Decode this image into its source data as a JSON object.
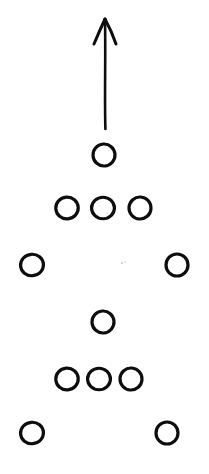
{
  "canvas": {
    "width": 209,
    "height": 474,
    "background_color": "#ffffff",
    "ink_color": "#0d0d0d",
    "title": "Formation Diagram"
  },
  "diagram": {
    "kind": "football-play-formation",
    "stroke_color": "#0d0d0d",
    "circle_radius": 11,
    "circle_stroke_width": 3.2,
    "arrow_stroke_width": 2.6
  },
  "arrow": {
    "name": "upward-route-arrow",
    "direction": "up",
    "tip_x": 105,
    "tip_y": 19,
    "tail_x": 105,
    "tail_y": 129,
    "head_left_x": 94,
    "head_left_y": 44,
    "head_right_x": 116,
    "head_right_y": 44,
    "length": 110
  },
  "rows": [
    {
      "name": "row-1-top-single",
      "label": "Top single",
      "count": 1,
      "cy": 155,
      "circles": [
        {
          "name": "player-r1-c1",
          "cx": 104,
          "cy": 155,
          "r": 11
        }
      ]
    },
    {
      "name": "row-2-triple",
      "label": "Upper triple",
      "count": 3,
      "cy": 208,
      "circles": [
        {
          "name": "player-r2-c1",
          "cx": 67,
          "cy": 208,
          "r": 11
        },
        {
          "name": "player-r2-c2",
          "cx": 103,
          "cy": 208,
          "r": 11
        },
        {
          "name": "player-r2-c3",
          "cx": 140,
          "cy": 208,
          "r": 11
        }
      ]
    },
    {
      "name": "row-3-wide-pair",
      "label": "Upper wide pair",
      "count": 2,
      "cy": 265,
      "circles": [
        {
          "name": "player-r3-left",
          "cx": 32,
          "cy": 265,
          "r": 11
        },
        {
          "name": "player-r3-right",
          "cx": 177,
          "cy": 265,
          "r": 11
        }
      ]
    },
    {
      "name": "row-4-center-single",
      "label": "Center single",
      "count": 1,
      "cy": 322,
      "circles": [
        {
          "name": "player-r4-c1",
          "cx": 103,
          "cy": 322,
          "r": 11
        }
      ]
    },
    {
      "name": "row-5-triple",
      "label": "Lower triple",
      "count": 3,
      "cy": 379,
      "circles": [
        {
          "name": "player-r5-c1",
          "cx": 67,
          "cy": 379,
          "r": 11
        },
        {
          "name": "player-r5-c2",
          "cx": 99,
          "cy": 379,
          "r": 11
        },
        {
          "name": "player-r5-c3",
          "cx": 131,
          "cy": 379,
          "r": 11
        }
      ]
    },
    {
      "name": "row-6-wide-pair",
      "label": "Lower wide pair",
      "count": 2,
      "cy": 433,
      "circles": [
        {
          "name": "player-r6-left",
          "cx": 32,
          "cy": 433,
          "r": 11
        },
        {
          "name": "player-r6-right",
          "cx": 167,
          "cy": 433,
          "r": 11
        }
      ]
    }
  ],
  "specks": [
    {
      "name": "scan-speck-1",
      "cx": 122,
      "cy": 263,
      "r": 1.1
    },
    {
      "name": "scan-speck-2",
      "cx": 125,
      "cy": 262,
      "r": 0.8
    }
  ],
  "totals": {
    "circle_count": 11,
    "arrow_count": 1
  }
}
